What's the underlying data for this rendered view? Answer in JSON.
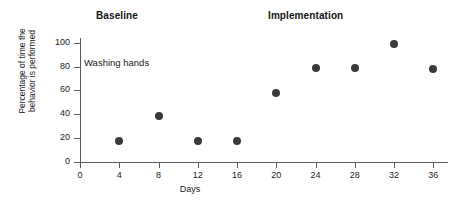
{
  "chart_data": {
    "type": "scatter",
    "title": "",
    "xlabel": "Days",
    "ylabel_line1": "Percentage of time the",
    "ylabel_line2": "behavior is performed",
    "xlim": [
      0,
      37.5
    ],
    "ylim": [
      0,
      104
    ],
    "grid": false,
    "legend": "none",
    "xticks": [
      0,
      4,
      8,
      12,
      16,
      20,
      24,
      28,
      32,
      36
    ],
    "xtick_labels": [
      "0",
      "4",
      "8",
      "12",
      "16",
      "20",
      "24",
      "28",
      "32",
      "36"
    ],
    "yticks": [
      0,
      20,
      40,
      60,
      80,
      100
    ],
    "ytick_labels": [
      "0",
      "20",
      "40",
      "60",
      "80",
      "100"
    ],
    "marker_color": "#3a3a3a",
    "axis_color": "#5a5a5a",
    "x": [
      4,
      8,
      12,
      16,
      20,
      24,
      28,
      32,
      36
    ],
    "values": [
      18,
      39,
      18,
      18,
      58,
      79,
      79,
      99,
      78
    ],
    "points": [
      {
        "x": 4,
        "y": 18,
        "phase": "Baseline"
      },
      {
        "x": 8,
        "y": 39,
        "phase": "Baseline"
      },
      {
        "x": 12,
        "y": 18,
        "phase": "Baseline"
      },
      {
        "x": 16,
        "y": 18,
        "phase": "Baseline"
      },
      {
        "x": 20,
        "y": 58,
        "phase": "Implementation"
      },
      {
        "x": 24,
        "y": 79,
        "phase": "Implementation"
      },
      {
        "x": 28,
        "y": 79,
        "phase": "Implementation"
      },
      {
        "x": 32,
        "y": 99,
        "phase": "Implementation"
      },
      {
        "x": 36,
        "y": 78,
        "phase": "Implementation"
      }
    ],
    "annotations": [
      {
        "text": "Washing hands",
        "x": 4,
        "y": 80
      }
    ],
    "phase_labels": [
      {
        "text": "Baseline",
        "x": 8
      },
      {
        "text": "Implementation",
        "x": 26
      }
    ]
  },
  "phases": {
    "baseline": "Baseline",
    "implementation": "Implementation"
  },
  "annotation": {
    "series_name": "Washing hands"
  },
  "axes": {
    "x_title": "Days",
    "y_title_line1": "Percentage of time the",
    "y_title_line2": "behavior is performed"
  }
}
